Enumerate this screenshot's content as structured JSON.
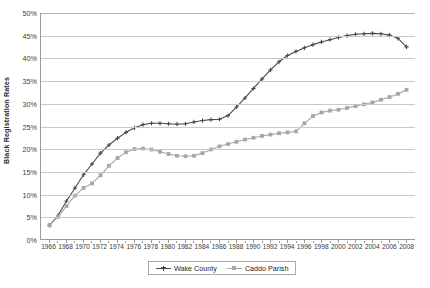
{
  "chart_data": {
    "type": "line",
    "title": "",
    "xlabel": "",
    "ylabel": "Black Registration Rates",
    "xlim": [
      1965,
      2009
    ],
    "ylim": [
      0,
      50
    ],
    "ytick_labels": [
      "0%",
      "5%",
      "10%",
      "15%",
      "20%",
      "25%",
      "30%",
      "35%",
      "40%",
      "45%",
      "50%"
    ],
    "ytick_values": [
      0,
      5,
      10,
      15,
      20,
      25,
      30,
      35,
      40,
      45,
      50
    ],
    "grid": true,
    "legend_position": "bottom",
    "x": [
      1966,
      1967,
      1968,
      1969,
      1970,
      1971,
      1972,
      1973,
      1974,
      1975,
      1976,
      1977,
      1978,
      1979,
      1980,
      1981,
      1982,
      1983,
      1984,
      1985,
      1986,
      1987,
      1988,
      1989,
      1990,
      1991,
      1992,
      1993,
      1994,
      1995,
      1996,
      1997,
      1998,
      1999,
      2000,
      2001,
      2002,
      2003,
      2004,
      2005,
      2006,
      2007,
      2008
    ],
    "xtick_labels": [
      "1966",
      "1968",
      "1970",
      "1972",
      "1974",
      "1976",
      "1978",
      "1980",
      "1982",
      "1984",
      "1986",
      "1988",
      "1990",
      "1992",
      "1994",
      "1996",
      "1998",
      "2000",
      "2002",
      "2004",
      "2006",
      "2008"
    ],
    "series": [
      {
        "name": "Wake County",
        "color": "#4a4a4a",
        "marker": "plus",
        "values": [
          3.0,
          5.2,
          8.4,
          11.3,
          14.2,
          16.6,
          19.0,
          20.8,
          22.3,
          23.6,
          24.6,
          25.3,
          25.6,
          25.6,
          25.5,
          25.4,
          25.5,
          25.9,
          26.2,
          26.4,
          26.5,
          27.3,
          29.2,
          31.2,
          33.3,
          35.4,
          37.4,
          39.2,
          40.6,
          41.5,
          42.3,
          43.0,
          43.6,
          44.1,
          44.6,
          45.0,
          45.3,
          45.4,
          45.5,
          45.4,
          45.1,
          44.4,
          42.5
        ]
      },
      {
        "name": "Caddo Parish",
        "color": "#a6a6a6",
        "marker": "square",
        "values": [
          3.1,
          4.9,
          7.3,
          9.6,
          11.3,
          12.3,
          14.1,
          16.2,
          17.9,
          19.2,
          19.9,
          20.0,
          19.8,
          19.3,
          18.8,
          18.4,
          18.3,
          18.4,
          19.0,
          19.8,
          20.5,
          21.0,
          21.5,
          22.0,
          22.4,
          22.8,
          23.1,
          23.4,
          23.6,
          23.8,
          25.6,
          27.2,
          28.0,
          28.4,
          28.6,
          29.0,
          29.4,
          29.8,
          30.2,
          30.8,
          31.4,
          32.1,
          33.0
        ]
      }
    ]
  },
  "legend": {
    "entries": [
      {
        "label": "Wake County"
      },
      {
        "label": "Caddo Parish"
      }
    ]
  },
  "caption": {
    "text": ""
  }
}
